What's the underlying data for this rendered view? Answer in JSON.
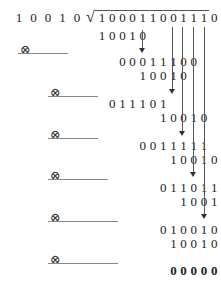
{
  "diagram": {
    "divisor": "10010",
    "dividend": "100011001110",
    "sqrt_symbol": "√",
    "xor_symbol": "⊗",
    "steps": [
      {
        "subtrahend": "10010",
        "xor_result": "00011100"
      },
      {
        "subtrahend": "10010",
        "xor_result": "011101"
      },
      {
        "subtrahend": "10010",
        "xor_result": "0011111"
      },
      {
        "subtrahend": "10010",
        "xor_result": "011011"
      },
      {
        "subtrahend": "10010",
        "xor_result": "010010"
      },
      {
        "subtrahend": "10010",
        "xor_result": "00000"
      }
    ],
    "remainder": "00000"
  }
}
